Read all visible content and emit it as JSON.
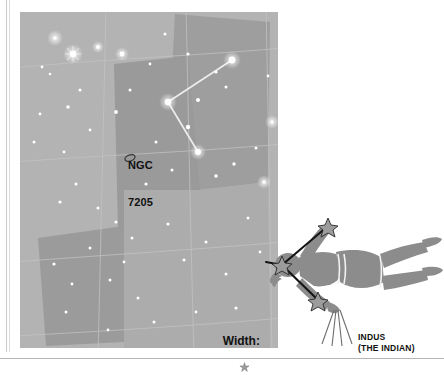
{
  "page": {
    "background_color": "#ffffff"
  },
  "star_chart": {
    "name": "indus-star-chart",
    "background_color": "#b3b3b3",
    "region_fill_dark": "#9a9a9a",
    "region_fill_mid": "#a6a6a6",
    "grid_color": "#c2c2c2",
    "star_color": "#ffffff",
    "constellation_line_color": "#e8e8e8",
    "deep_sky_objects": [
      {
        "id": "ngc-7205",
        "symbol": "galaxy-ellipse",
        "label_line1": "NGC",
        "label_line2": "7205",
        "x": 120,
        "y": 145
      }
    ],
    "scale_legend": {
      "label": "Width:",
      "symbol": "star-glyph"
    },
    "stars": [
      {
        "x": 35,
        "y": 26,
        "mag": 1.6
      },
      {
        "x": 53,
        "y": 42,
        "mag": 3.2
      },
      {
        "x": 78,
        "y": 35,
        "mag": 2.0
      },
      {
        "x": 102,
        "y": 42,
        "mag": 2.4
      },
      {
        "x": 22,
        "y": 55,
        "mag": 1.4
      },
      {
        "x": 30,
        "y": 62,
        "mag": 1.3
      },
      {
        "x": 60,
        "y": 78,
        "mag": 1.5
      },
      {
        "x": 48,
        "y": 95,
        "mag": 1.8
      },
      {
        "x": 20,
        "y": 102,
        "mag": 1.4
      },
      {
        "x": 14,
        "y": 130,
        "mag": 1.5
      },
      {
        "x": 44,
        "y": 140,
        "mag": 1.4
      },
      {
        "x": 70,
        "y": 118,
        "mag": 1.4
      },
      {
        "x": 96,
        "y": 100,
        "mag": 1.9
      },
      {
        "x": 110,
        "y": 78,
        "mag": 1.5
      },
      {
        "x": 130,
        "y": 52,
        "mag": 1.4
      },
      {
        "x": 145,
        "y": 22,
        "mag": 1.5
      },
      {
        "x": 168,
        "y": 42,
        "mag": 1.6
      },
      {
        "x": 178,
        "y": 88,
        "mag": 2.0
      },
      {
        "x": 196,
        "y": 60,
        "mag": 1.6
      },
      {
        "x": 206,
        "y": 75,
        "mag": 1.5
      },
      {
        "x": 212,
        "y": 48,
        "mag": 3.4
      },
      {
        "x": 148,
        "y": 90,
        "mag": 3.2
      },
      {
        "x": 168,
        "y": 115,
        "mag": 2.2
      },
      {
        "x": 178,
        "y": 140,
        "mag": 3.0
      },
      {
        "x": 126,
        "y": 172,
        "mag": 1.6
      },
      {
        "x": 152,
        "y": 158,
        "mag": 1.5
      },
      {
        "x": 196,
        "y": 164,
        "mag": 1.8
      },
      {
        "x": 214,
        "y": 152,
        "mag": 1.7
      },
      {
        "x": 236,
        "y": 136,
        "mag": 1.5
      },
      {
        "x": 244,
        "y": 170,
        "mag": 1.5
      },
      {
        "x": 56,
        "y": 172,
        "mag": 1.5
      },
      {
        "x": 40,
        "y": 190,
        "mag": 1.6
      },
      {
        "x": 78,
        "y": 196,
        "mag": 1.5
      },
      {
        "x": 96,
        "y": 210,
        "mag": 1.6
      },
      {
        "x": 112,
        "y": 226,
        "mag": 1.5
      },
      {
        "x": 70,
        "y": 236,
        "mag": 1.5
      },
      {
        "x": 34,
        "y": 252,
        "mag": 1.6
      },
      {
        "x": 52,
        "y": 272,
        "mag": 1.4
      },
      {
        "x": 90,
        "y": 268,
        "mag": 1.5
      },
      {
        "x": 104,
        "y": 250,
        "mag": 1.4
      },
      {
        "x": 118,
        "y": 286,
        "mag": 1.5
      },
      {
        "x": 148,
        "y": 212,
        "mag": 1.6
      },
      {
        "x": 164,
        "y": 248,
        "mag": 1.5
      },
      {
        "x": 186,
        "y": 230,
        "mag": 1.5
      },
      {
        "x": 206,
        "y": 262,
        "mag": 1.5
      },
      {
        "x": 228,
        "y": 206,
        "mag": 1.5
      },
      {
        "x": 240,
        "y": 240,
        "mag": 1.4
      },
      {
        "x": 216,
        "y": 296,
        "mag": 1.6
      },
      {
        "x": 134,
        "y": 310,
        "mag": 1.5
      },
      {
        "x": 88,
        "y": 318,
        "mag": 1.4
      },
      {
        "x": 46,
        "y": 300,
        "mag": 1.5
      },
      {
        "x": 176,
        "y": 300,
        "mag": 1.4
      },
      {
        "x": 252,
        "y": 110,
        "mag": 1.4
      },
      {
        "x": 248,
        "y": 64,
        "mag": 1.4
      },
      {
        "x": 136,
        "y": 130,
        "mag": 1.5
      }
    ],
    "constellation_lines": [
      {
        "x1": 212,
        "y1": 48,
        "x2": 148,
        "y2": 90
      },
      {
        "x1": 148,
        "y1": 90,
        "x2": 178,
        "y2": 140
      }
    ]
  },
  "indus_figure": {
    "name": "indus-constellation-figure",
    "silhouette_color": "#8c8c8c",
    "star_marker_color": "#8c8c8c",
    "line_color": "#1a1a1a",
    "caption_line1": "INDUS",
    "caption_line2": "(THE INDIAN)"
  }
}
